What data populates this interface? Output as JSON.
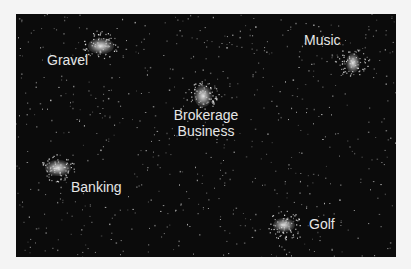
{
  "figure": {
    "background_color": "#0b0b0b",
    "page_color": "#f4f4f4",
    "clusters": [
      {
        "id": "gravel",
        "label": "Gravel",
        "cx": 84,
        "cy": 31,
        "rx": 12,
        "ry": 7,
        "label_x": 31,
        "label_y": 38
      },
      {
        "id": "brokerage",
        "label_lines": [
          "Brokerage",
          "Business"
        ],
        "cx": 186,
        "cy": 81,
        "rx": 8,
        "ry": 10,
        "label_x": 150,
        "label_y": 93
      },
      {
        "id": "music",
        "label": "Music",
        "cx": 336,
        "cy": 48,
        "rx": 6,
        "ry": 9,
        "label_x": 288,
        "label_y": 18
      },
      {
        "id": "banking",
        "label": "Banking",
        "cx": 42,
        "cy": 154,
        "rx": 13,
        "ry": 8,
        "label_x": 55,
        "label_y": 165
      },
      {
        "id": "golf",
        "label": "Golf",
        "cx": 268,
        "cy": 211,
        "rx": 11,
        "ry": 7,
        "label_x": 293,
        "label_y": 202
      }
    ]
  }
}
